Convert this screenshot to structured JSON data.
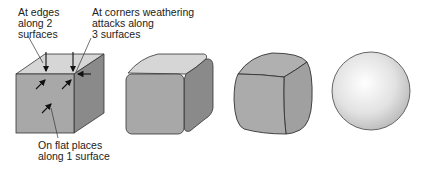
{
  "diagram": {
    "labels": {
      "edges": [
        "At edges",
        "along 2",
        "surfaces"
      ],
      "corners": [
        "At corners weathering",
        "attacks along",
        "3 surfaces"
      ],
      "flat": [
        "On flat places",
        "along 1 surface"
      ]
    },
    "stages": [
      {
        "name": "sharp-cube",
        "description": "Fresh jointed block with sharp edges and corners"
      },
      {
        "name": "rounded-edges-cube",
        "description": "Corners and edges begin to round"
      },
      {
        "name": "rounded-block",
        "description": "Strongly rounded block"
      },
      {
        "name": "sphere",
        "description": "Final spheroidal shape"
      }
    ],
    "colors": {
      "top_face": "#d6d6d6",
      "front_face": "#a8a8a8",
      "side_face": "#8a8a8a",
      "outline": "#333333",
      "sphere_highlight": "#ffffff",
      "sphere_shadow": "#b8b8b8"
    }
  }
}
